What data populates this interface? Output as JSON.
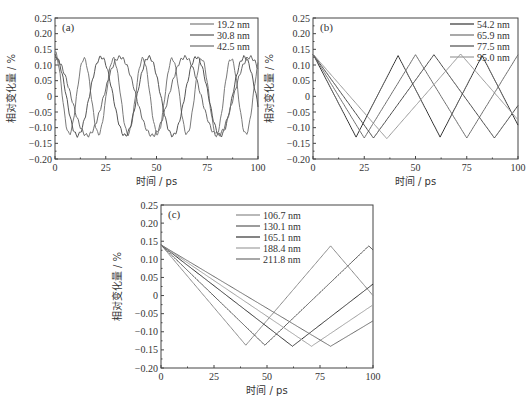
{
  "chart_data": [
    {
      "id": "a",
      "type": "line",
      "panel_label": "(a)",
      "xlabel": "时间 / ps",
      "ylabel": "相对变化量 / %",
      "xlim": [
        0,
        100
      ],
      "ylim": [
        -0.2,
        0.25
      ],
      "xticks": [
        "0",
        "25",
        "50",
        "75",
        "100"
      ],
      "yticks": [
        "0.25",
        "0.20",
        "0.15",
        "0.10",
        "0.05",
        "0",
        "-0.05",
        "-0.10",
        "-0.15",
        "-0.20"
      ],
      "legend_position": "upper right",
      "series": [
        {
          "name": "19.2 nm",
          "color": "#7a7a7a",
          "waveform": "sine",
          "amplitude": 0.12,
          "start": 0.14,
          "first_min_t": 7,
          "period": 14.5
        },
        {
          "name": "30.8 nm",
          "color": "#555555",
          "waveform": "sine",
          "amplitude": 0.125,
          "start": 0.13,
          "first_min_t": 11,
          "period": 23.5
        },
        {
          "name": "42.5 nm",
          "color": "#6a6a6a",
          "waveform": "sine",
          "amplitude": 0.125,
          "start": 0.12,
          "first_min_t": 16,
          "period": 32
        }
      ]
    },
    {
      "id": "b",
      "type": "line",
      "panel_label": "(b)",
      "xlabel": "时间 / ps",
      "ylabel": "相对变化量 / %",
      "xlim": [
        0,
        100
      ],
      "ylim": [
        -0.2,
        0.25
      ],
      "xticks": [
        "0",
        "25",
        "50",
        "75",
        "100"
      ],
      "yticks": [
        "0.25",
        "0.20",
        "0.15",
        "0.10",
        "0.05",
        "0",
        "-0.05",
        "-0.10",
        "-0.15",
        "-0.20"
      ],
      "legend_position": "upper right",
      "series": [
        {
          "name": "54.2 nm",
          "color": "#333333",
          "waveform": "triangle",
          "amplitude": 0.13,
          "start": 0.135,
          "first_min_t": 21,
          "period": 41
        },
        {
          "name": "65.9 nm",
          "color": "#707070",
          "waveform": "triangle",
          "amplitude": 0.133,
          "start": 0.135,
          "first_min_t": 25,
          "period": 50
        },
        {
          "name": "77.5 nm",
          "color": "#4a4a4a",
          "waveform": "triangle",
          "amplitude": 0.133,
          "start": 0.135,
          "first_min_t": 29.5,
          "period": 59
        },
        {
          "name": "95.0 nm",
          "color": "#9a9a9a",
          "waveform": "triangle",
          "amplitude": 0.135,
          "start": 0.135,
          "first_min_t": 36,
          "period": 72
        }
      ]
    },
    {
      "id": "c",
      "type": "line",
      "panel_label": "(c)",
      "xlabel": "时间 / ps",
      "ylabel": "相对变化量 / %",
      "xlim": [
        0,
        100
      ],
      "ylim": [
        -0.2,
        0.25
      ],
      "xticks": [
        "0",
        "25",
        "50",
        "75",
        "100"
      ],
      "yticks": [
        "0.25",
        "0.20",
        "0.15",
        "0.10",
        "0.05",
        "0",
        "-0.05",
        "-0.10",
        "-0.15",
        "-0.20"
      ],
      "legend_position": "upper center",
      "series": [
        {
          "name": "106.7 nm",
          "color": "#8a8a8a",
          "waveform": "triangle",
          "amplitude": 0.137,
          "start": 0.14,
          "first_min_t": 40,
          "period": 80
        },
        {
          "name": "130.1 nm",
          "color": "#5a5a5a",
          "waveform": "triangle",
          "amplitude": 0.137,
          "start": 0.14,
          "first_min_t": 49,
          "period": 98
        },
        {
          "name": "165.1 nm",
          "color": "#333333",
          "waveform": "triangle",
          "amplitude": 0.14,
          "start": 0.14,
          "first_min_t": 62,
          "period": 124
        },
        {
          "name": "188.4 nm",
          "color": "#a0a0a0",
          "waveform": "triangle",
          "amplitude": 0.14,
          "start": 0.14,
          "first_min_t": 71,
          "period": 142
        },
        {
          "name": "211.8 nm",
          "color": "#6e6e6e",
          "waveform": "triangle",
          "amplitude": 0.14,
          "start": 0.14,
          "first_min_t": 80,
          "period": 160
        }
      ]
    }
  ],
  "panels": {
    "a": {
      "label": "(a)",
      "xlabel": "时间 / ps",
      "ylabel": "相对变化量 / %"
    },
    "b": {
      "label": "(b)",
      "xlabel": "时间 / ps",
      "ylabel": "相对变化量 / %"
    },
    "c": {
      "label": "(c)",
      "xlabel": "时间 / ps",
      "ylabel": "相对变化量 / %"
    }
  }
}
